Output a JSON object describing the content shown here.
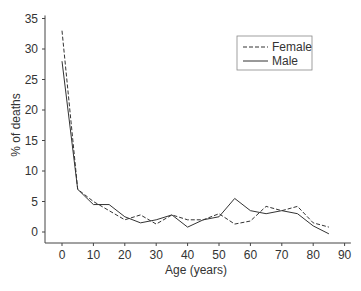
{
  "chart_data": {
    "type": "line",
    "title": "",
    "xlabel": "Age (years)",
    "ylabel": "% of deaths",
    "x": [
      0,
      5,
      10,
      15,
      20,
      25,
      30,
      35,
      40,
      45,
      50,
      55,
      60,
      65,
      70,
      75,
      80,
      85
    ],
    "xticks": [
      0,
      10,
      20,
      30,
      40,
      50,
      60,
      70,
      80,
      90
    ],
    "yticks": [
      0,
      5,
      10,
      15,
      20,
      25,
      30,
      35
    ],
    "xlim": [
      -5,
      92
    ],
    "ylim": [
      -2,
      35.5
    ],
    "grid": false,
    "legend_position": "upper right",
    "series": [
      {
        "name": "Female",
        "style": "dashed",
        "values": [
          33,
          7,
          5,
          3.5,
          2,
          2.8,
          1.3,
          2.8,
          2,
          2,
          3,
          1.3,
          1.8,
          4.2,
          3.5,
          4.2,
          1.5,
          0.8
        ]
      },
      {
        "name": "Male",
        "style": "solid",
        "values": [
          28,
          7,
          4.5,
          4.5,
          2.5,
          1.5,
          2,
          2.8,
          0.8,
          2,
          2.5,
          5.5,
          3.5,
          3,
          3.5,
          3,
          1,
          -0.3
        ]
      }
    ]
  }
}
